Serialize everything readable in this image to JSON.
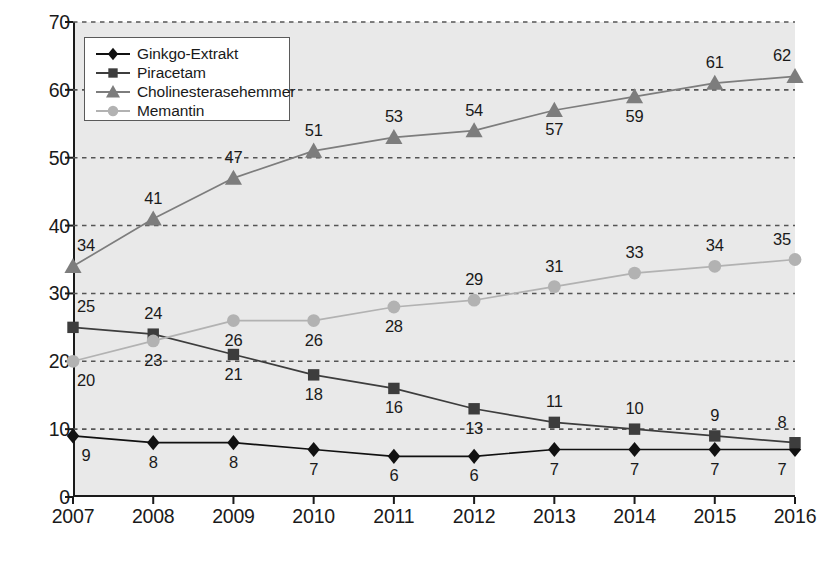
{
  "chart_data": {
    "type": "line",
    "title": "",
    "xlabel": "",
    "ylabel": "(Mio. DDD)",
    "categories": [
      "2007",
      "2008",
      "2009",
      "2010",
      "2011",
      "2012",
      "2013",
      "2014",
      "2015",
      "2016"
    ],
    "ylim": [
      0,
      70
    ],
    "yticks": [
      0,
      10,
      20,
      30,
      40,
      50,
      60,
      70
    ],
    "grid": true,
    "legend_position": "upper-left-inside",
    "series": [
      {
        "name": "Ginkgo-Extrakt",
        "marker": "diamond",
        "color": "#111111",
        "values": [
          9,
          8,
          8,
          7,
          6,
          6,
          7,
          7,
          7,
          7
        ],
        "label_side": [
          "below",
          "below",
          "below",
          "below",
          "below",
          "below",
          "below",
          "below",
          "below",
          "below"
        ]
      },
      {
        "name": "Piracetam",
        "marker": "square",
        "color": "#3d3d3d",
        "values": [
          25,
          24,
          21,
          18,
          16,
          13,
          11,
          10,
          9,
          8
        ],
        "label_side": [
          "above",
          "above",
          "below",
          "below",
          "below",
          "below",
          "above",
          "above",
          "above",
          "above"
        ]
      },
      {
        "name": "Cholinesterasehemmer",
        "marker": "triangle",
        "color": "#7d7d7d",
        "values": [
          34,
          41,
          47,
          51,
          53,
          54,
          57,
          59,
          61,
          62
        ],
        "label_side": [
          "above",
          "above",
          "above",
          "above",
          "above",
          "above",
          "below",
          "below",
          "above",
          "above"
        ]
      },
      {
        "name": "Memantin",
        "marker": "circle",
        "color": "#b2b2b2",
        "values": [
          20,
          23,
          26,
          26,
          28,
          29,
          31,
          33,
          34,
          35
        ],
        "label_side": [
          "below",
          "below",
          "below",
          "below",
          "below",
          "above",
          "above",
          "above",
          "above",
          "above"
        ]
      }
    ]
  },
  "axes": {
    "y_label": "(Mio. DDD)",
    "y_tick_labels": [
      "0",
      "10",
      "20",
      "30",
      "40",
      "50",
      "60",
      "70"
    ],
    "x_tick_labels": [
      "2007",
      "2008",
      "2009",
      "2010",
      "2011",
      "2012",
      "2013",
      "2014",
      "2015",
      "2016"
    ]
  },
  "legend": {
    "items": [
      {
        "label": "Ginkgo-Extrakt",
        "marker": "diamond-marker-icon",
        "color": "#111111"
      },
      {
        "label": "Piracetam",
        "marker": "square-marker-icon",
        "color": "#3d3d3d"
      },
      {
        "label": "Cholinesterasehemmer",
        "marker": "triangle-marker-icon",
        "color": "#7d7d7d"
      },
      {
        "label": "Memantin",
        "marker": "circle-marker-icon",
        "color": "#b2b2b2"
      }
    ]
  },
  "style": {
    "plot_background": "#e9e9e9",
    "axis_color": "#1a1a1a",
    "grid_color": "#555555",
    "page_background": "#ffffff"
  }
}
